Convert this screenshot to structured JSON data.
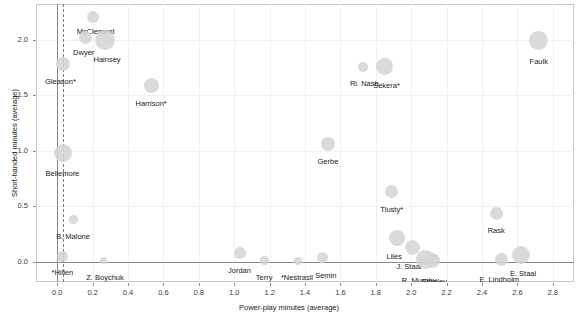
{
  "chart_data": {
    "type": "scatter",
    "title": "",
    "xlabel": "Power-play minutes (average)",
    "ylabel": "Short-handed minutes (average)",
    "xlim": [
      -0.12,
      2.92
    ],
    "ylim": [
      -0.18,
      2.32
    ],
    "xticks": [
      "0.0",
      "0.2",
      "0.4",
      "0.6",
      "0.8",
      "1.0",
      "1.2",
      "1.4",
      "1.6",
      "1.8",
      "2.0",
      "2.2",
      "2.4",
      "2.6",
      "2.8"
    ],
    "xtick_values": [
      0.0,
      0.2,
      0.4,
      0.6,
      0.8,
      1.0,
      1.2,
      1.4,
      1.6,
      1.8,
      2.0,
      2.2,
      2.4,
      2.6,
      2.8
    ],
    "yticks": [
      "0.0",
      "0.5",
      "1.0",
      "1.5",
      "2.0"
    ],
    "ytick_values": [
      0.0,
      0.5,
      1.0,
      1.5,
      2.0
    ],
    "grid": true,
    "legend": "none",
    "bubble_color": "#d4d4d4",
    "reference_line_x": 0.03,
    "size_encoding": "bubble radius encodes total ice time",
    "points": [
      {
        "label": "McClement",
        "x": 0.2,
        "y": 2.2,
        "r": 6.0,
        "label_dx": 3,
        "label_dy": 10,
        "label_anchor": "middle"
      },
      {
        "label": "Dwyer",
        "x": 0.16,
        "y": 2.02,
        "r": 6.5,
        "label_dx": -2,
        "label_dy": 11,
        "label_anchor": "middle"
      },
      {
        "label": "Hainsey",
        "x": 0.27,
        "y": 2.0,
        "r": 10.0,
        "label_dx": 2,
        "label_dy": 15,
        "label_anchor": "middle"
      },
      {
        "label": "Gleason*",
        "x": 0.03,
        "y": 1.78,
        "r": 7.0,
        "label_dx": -2,
        "label_dy": 13,
        "label_anchor": "middle"
      },
      {
        "label": "Harrison*",
        "x": 0.53,
        "y": 1.59,
        "r": 7.5,
        "label_dx": 0,
        "label_dy": 14,
        "label_anchor": "middle"
      },
      {
        "label": "Ri. Nash",
        "x": 1.73,
        "y": 1.75,
        "r": 5.0,
        "label_dx": 1,
        "label_dy": 12,
        "label_anchor": "middle"
      },
      {
        "label": "Sekera*",
        "x": 1.85,
        "y": 1.76,
        "r": 8.5,
        "label_dx": 2,
        "label_dy": 15,
        "label_anchor": "middle"
      },
      {
        "label": "Faulk",
        "x": 2.72,
        "y": 1.99,
        "r": 9.5,
        "label_dx": 0,
        "label_dy": 16,
        "label_anchor": "middle"
      },
      {
        "label": "Bellemore",
        "x": 0.03,
        "y": 0.98,
        "r": 9.0,
        "label_dx": 0,
        "label_dy": 16,
        "label_anchor": "middle"
      },
      {
        "label": "Gerbe",
        "x": 1.53,
        "y": 1.06,
        "r": 7.0,
        "label_dx": 0,
        "label_dy": 13,
        "label_anchor": "middle"
      },
      {
        "label": "Tlusty*",
        "x": 1.89,
        "y": 0.63,
        "r": 6.5,
        "label_dx": 0,
        "label_dy": 13,
        "label_anchor": "middle"
      },
      {
        "label": "Rask",
        "x": 2.48,
        "y": 0.44,
        "r": 6.5,
        "label_dx": 0,
        "label_dy": 13,
        "label_anchor": "middle"
      },
      {
        "label": "B. Malone",
        "x": 0.09,
        "y": 0.38,
        "r": 4.5,
        "label_dx": 0,
        "label_dy": 12,
        "label_anchor": "middle"
      },
      {
        "label": "Liles",
        "x": 1.92,
        "y": 0.22,
        "r": 8.0,
        "label_dx": -3,
        "label_dy": 14,
        "label_anchor": "middle"
      },
      {
        "label": "J. Staal",
        "x": 2.01,
        "y": 0.13,
        "r": 7.5,
        "label_dx": -4,
        "label_dy": 14,
        "label_anchor": "middle"
      },
      {
        "label": "E. Staal",
        "x": 2.62,
        "y": 0.06,
        "r": 9.0,
        "label_dx": 2,
        "label_dy": 14,
        "label_anchor": "middle"
      },
      {
        "label": "E. Lindholm",
        "x": 2.51,
        "y": 0.02,
        "r": 6.5,
        "label_dx": -2,
        "label_dy": 15,
        "label_anchor": "middle"
      },
      {
        "label": "R. Murphy",
        "x": 2.08,
        "y": 0.02,
        "r": 9.5,
        "label_dx": -6,
        "label_dy": 16,
        "label_anchor": "middle"
      },
      {
        "label": "Stanley",
        "x": 2.12,
        "y": 0.01,
        "r": 7.5,
        "label_dx": 2,
        "label_dy": 16,
        "label_anchor": "middle"
      },
      {
        "label": "*Hillen",
        "x": 0.03,
        "y": 0.05,
        "r": 5.5,
        "label_dx": 0,
        "label_dy": 12,
        "label_anchor": "middle"
      },
      {
        "label": "Z. Boychuk",
        "x": 0.26,
        "y": 0.01,
        "r": 3.5,
        "label_dx": 2,
        "label_dy": 12,
        "label_anchor": "middle"
      },
      {
        "label": "Jordan",
        "x": 1.03,
        "y": 0.08,
        "r": 6.0,
        "label_dx": 0,
        "label_dy": 13,
        "label_anchor": "middle"
      },
      {
        "label": "Terry",
        "x": 1.17,
        "y": 0.01,
        "r": 4.5,
        "label_dx": 0,
        "label_dy": 12,
        "label_anchor": "middle"
      },
      {
        "label": "*Nestrasil",
        "x": 1.36,
        "y": 0.01,
        "r": 4.0,
        "label_dx": -1,
        "label_dy": 12,
        "label_anchor": "middle"
      },
      {
        "label": "Semin",
        "x": 1.5,
        "y": 0.04,
        "r": 5.5,
        "label_dx": 3,
        "label_dy": 13,
        "label_anchor": "middle"
      }
    ]
  }
}
